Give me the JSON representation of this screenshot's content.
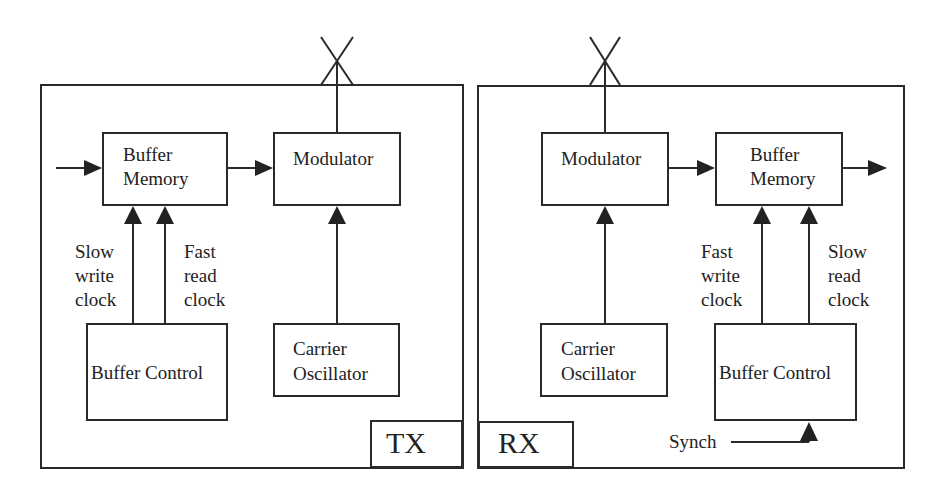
{
  "diagram": {
    "type": "block-diagram",
    "tx": {
      "label": "TX",
      "blocks": {
        "buffer_memory": {
          "line1": "Buffer",
          "line2": "Memory"
        },
        "modulator": {
          "line1": "Modulator"
        },
        "buffer_control": {
          "line1": "Buffer Control"
        },
        "carrier_oscillator": {
          "line1": "Carrier",
          "line2": "Oscillator"
        }
      },
      "clocks": {
        "write": {
          "line1": "Slow",
          "line2": "write",
          "line3": "clock"
        },
        "read": {
          "line1": "Fast",
          "line2": "read",
          "line3": "clock"
        }
      }
    },
    "rx": {
      "label": "RX",
      "blocks": {
        "modulator": {
          "line1": "Modulator"
        },
        "buffer_memory": {
          "line1": "Buffer",
          "line2": "Memory"
        },
        "carrier_oscillator": {
          "line1": "Carrier",
          "line2": "Oscillator"
        },
        "buffer_control": {
          "line1": "Buffer Control"
        }
      },
      "clocks": {
        "write": {
          "line1": "Fast",
          "line2": "write",
          "line3": "clock"
        },
        "read": {
          "line1": "Slow",
          "line2": "read",
          "line3": "clock"
        }
      },
      "synch_label": "Synch"
    },
    "colors": {
      "line": "#2a2a2a",
      "background": "#ffffff"
    }
  }
}
